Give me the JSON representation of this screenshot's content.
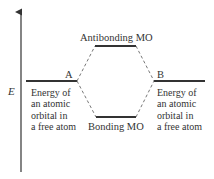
{
  "diagram": {
    "axis_label": "E",
    "levels": {
      "antibonding": {
        "label": "Antibonding MO"
      },
      "bonding": {
        "label": "Bonding MO"
      },
      "atom_a": {
        "label": "A",
        "description": [
          "Energy of",
          "an atomic",
          "orbital in",
          "a free atom"
        ]
      },
      "atom_b": {
        "label": "B",
        "description": [
          "Energy of",
          "an atomic",
          "orbital in",
          "a free atom"
        ]
      }
    },
    "colors": {
      "lines": "#333333",
      "background": "#ffffff"
    }
  }
}
